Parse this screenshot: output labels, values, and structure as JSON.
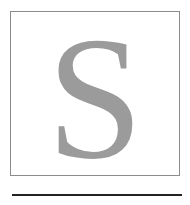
{
  "dropcap": {
    "letter": "S",
    "letter_color": "#9b9b9b",
    "border_color": "#8c8c8c"
  },
  "rule": {
    "color": "#222222"
  }
}
